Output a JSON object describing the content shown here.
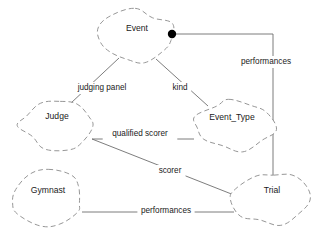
{
  "diagram": {
    "type": "entity-relationship",
    "background_color": "#ffffff",
    "line_color": "#6e6e6e",
    "outline_color": "#8a8a8a",
    "text_color": "#1a1a1a",
    "junction_color": "#000000",
    "entities": [
      {
        "id": "event",
        "label": "Event",
        "cx": 137,
        "cy": 36,
        "rx": 38,
        "ry": 25,
        "seed": 11
      },
      {
        "id": "judge",
        "label": "Judge",
        "cx": 57,
        "cy": 124,
        "rx": 38,
        "ry": 26,
        "seed": 3
      },
      {
        "id": "event_type",
        "label": "Event_Type",
        "cx": 232,
        "cy": 125,
        "rx": 41,
        "ry": 26,
        "seed": 7
      },
      {
        "id": "gymnast",
        "label": "Gymnast",
        "cx": 48,
        "cy": 198,
        "rx": 38,
        "ry": 26,
        "seed": 5
      },
      {
        "id": "trial",
        "label": "Trial",
        "cx": 272,
        "cy": 198,
        "rx": 38,
        "ry": 26,
        "seed": 9
      }
    ],
    "relationships": [
      {
        "id": "judging-panel",
        "label": "judging panel",
        "from": "event",
        "to": "judge",
        "label_x": 102,
        "label_y": 88
      },
      {
        "id": "kind",
        "label": "kind",
        "from": "event",
        "to": "event_type",
        "label_x": 180,
        "label_y": 88
      },
      {
        "id": "performances-event-trial",
        "label": "performances",
        "from": "event",
        "to": "trial",
        "label_x": 266,
        "label_y": 62
      },
      {
        "id": "qualified-scorer",
        "label": "qualified scorer",
        "from": "judge",
        "to": "event_type",
        "label_x": 140,
        "label_y": 134
      },
      {
        "id": "scorer",
        "label": "scorer",
        "from": "judge",
        "to": "trial",
        "label_x": 170,
        "label_y": 171
      },
      {
        "id": "performances-gymnast-trial",
        "label": "performances",
        "from": "gymnast",
        "to": "trial",
        "label_x": 166,
        "label_y": 211
      }
    ],
    "junction": {
      "id": "event-performances-junction",
      "x": 172,
      "y": 34,
      "r": 4.2
    }
  }
}
